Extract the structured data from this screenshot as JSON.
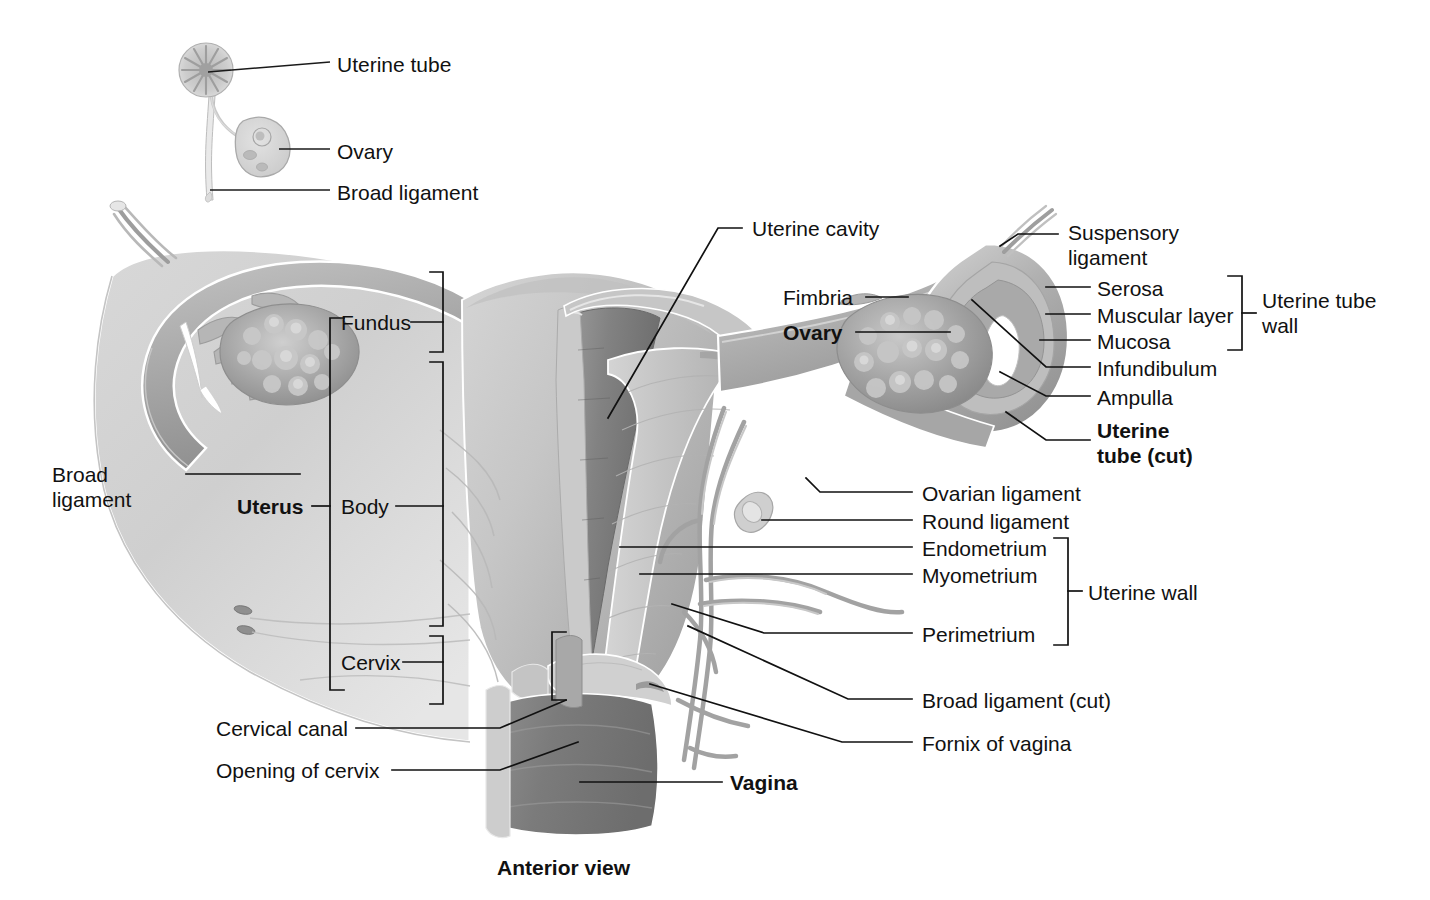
{
  "figure": {
    "caption": "Anterior view",
    "colors": {
      "ink": "#111111",
      "leader": "#1a1a1a",
      "tissue_light": "#dcdcdc",
      "tissue_mid": "#b4b4b4",
      "tissue_dark": "#8c8c8c",
      "cavity_dark": "#6f6f6f",
      "vagina_dark": "#7a7a7a",
      "vessel": "#9a9a9a",
      "background": "#ffffff"
    }
  },
  "inset": {
    "labels": [
      {
        "id": "uterine-tube",
        "text": "Uterine tube",
        "x": 337,
        "y": 52
      },
      {
        "id": "ovary",
        "text": "Ovary",
        "x": 337,
        "y": 139
      },
      {
        "id": "broad-ligament",
        "text": "Broad ligament",
        "x": 337,
        "y": 180
      }
    ]
  },
  "labels_left": [
    {
      "id": "broad-ligament",
      "text": "Broad\nligament",
      "x": 52,
      "y": 462,
      "bold": false
    },
    {
      "id": "uterus",
      "text": "Uterus",
      "x": 237,
      "y": 494,
      "bold": true
    },
    {
      "id": "cervical-canal",
      "text": "Cervical canal",
      "x": 216,
      "y": 718,
      "bold": false
    },
    {
      "id": "opening-of-cervix",
      "text": "Opening of cervix",
      "x": 216,
      "y": 760,
      "bold": false
    }
  ],
  "labels_bracket_uterus": [
    {
      "id": "fundus",
      "text": "Fundus",
      "x": 341,
      "y": 310
    },
    {
      "id": "body",
      "text": "Body",
      "x": 341,
      "y": 494
    },
    {
      "id": "cervix",
      "text": "Cervix",
      "x": 341,
      "y": 650
    }
  ],
  "labels_center": [
    {
      "id": "uterine-cavity",
      "text": "Uterine cavity",
      "x": 752,
      "y": 219
    },
    {
      "id": "fimbria",
      "text": "Fimbria",
      "x": 783,
      "y": 288,
      "bold": false
    },
    {
      "id": "ovary",
      "text": "Ovary",
      "x": 783,
      "y": 323,
      "bold": true
    },
    {
      "id": "vagina",
      "text": "Vagina",
      "x": 730,
      "y": 772,
      "bold": true
    }
  ],
  "labels_right_upper": [
    {
      "id": "suspensory-ligament",
      "text": "Suspensory\nligament",
      "x": 1068,
      "y": 220
    },
    {
      "id": "serosa",
      "text": "Serosa",
      "x": 1097,
      "y": 277
    },
    {
      "id": "muscular-layer",
      "text": "Muscular layer",
      "x": 1097,
      "y": 303
    },
    {
      "id": "mucosa",
      "text": "Mucosa",
      "x": 1097,
      "y": 330
    },
    {
      "id": "infundibulum",
      "text": "Infundibulum",
      "x": 1097,
      "y": 356
    },
    {
      "id": "ampulla",
      "text": "Ampulla",
      "x": 1097,
      "y": 385
    },
    {
      "id": "uterine-tube-cut",
      "text": "Uterine\ntube (cut)",
      "x": 1097,
      "y": 420,
      "bold": true
    }
  ],
  "labels_right_lower": [
    {
      "id": "ovarian-ligament",
      "text": "Ovarian ligament",
      "x": 922,
      "y": 482
    },
    {
      "id": "round-ligament",
      "text": "Round ligament",
      "x": 922,
      "y": 510
    },
    {
      "id": "endometrium",
      "text": "Endometrium",
      "x": 922,
      "y": 537
    },
    {
      "id": "myometrium",
      "text": "Myometrium",
      "x": 922,
      "y": 564
    },
    {
      "id": "perimetrium",
      "text": "Perimetrium",
      "x": 922,
      "y": 623
    },
    {
      "id": "broad-ligament-cut",
      "text": "Broad ligament (cut)",
      "x": 922,
      "y": 689
    },
    {
      "id": "fornix-of-vagina",
      "text": "Fornix of vagina",
      "x": 922,
      "y": 732
    }
  ],
  "bracket_labels": [
    {
      "id": "uterine-tube-wall",
      "text": "Uterine tube\nwall",
      "x": 1262,
      "y": 288
    },
    {
      "id": "uterine-wall",
      "text": "Uterine wall",
      "x": 1088,
      "y": 581
    }
  ],
  "caption": {
    "text": "Anterior view",
    "x": 497,
    "y": 857
  }
}
